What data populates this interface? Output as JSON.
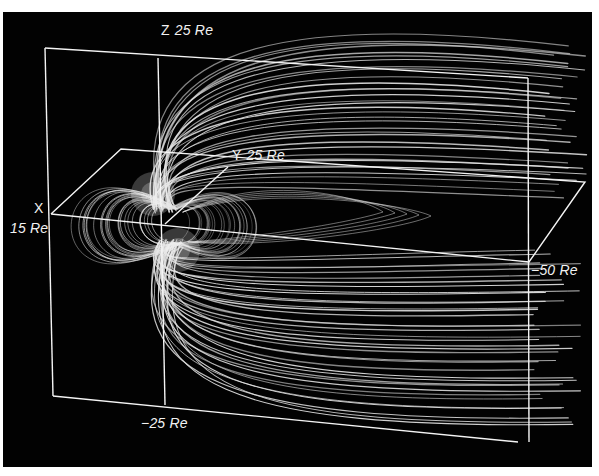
{
  "figure": {
    "colors": {
      "background": "#020202",
      "lines": "#e6e6e6",
      "frame": "#ffffff",
      "border": "#ffffff"
    }
  },
  "labels": {
    "z_axis": {
      "axis": "Z",
      "value": "25 Re"
    },
    "y_axis": {
      "axis": "Y",
      "value": "25 Re"
    },
    "x_axis": {
      "axis": "X",
      "value": "15 Re"
    },
    "x_far": {
      "value": "−50 Re"
    },
    "z_bottom": {
      "value": "−25 Re"
    }
  }
}
